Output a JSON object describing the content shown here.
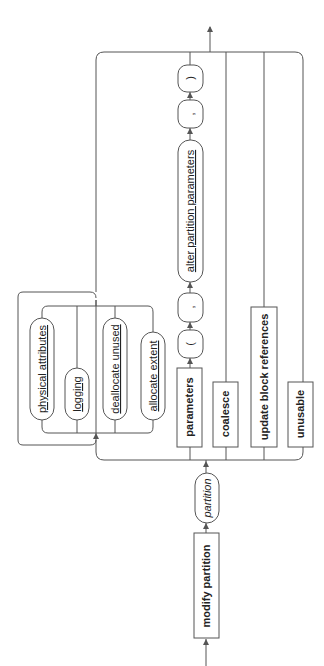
{
  "diagram": {
    "type": "railroad-syntax-diagram",
    "orientation": "rotated-90-ccw (flow bottom to top)",
    "line_color": "#555555",
    "text_color": "#222222",
    "nodes": {
      "modify_partition": "modify partition",
      "partition": "partition",
      "physical_attributes": "physical attributes",
      "logging": "logging",
      "deallocate_unused": "deallocate unused",
      "allocate_extent": "allocate extent",
      "parameters": "parameters",
      "open_paren": "(",
      "comma1": ",",
      "alter_partition_parameters": "alter partition parameters",
      "comma2": ",",
      "close_paren": ")",
      "coalesce": "coalesce",
      "update_block_references": "update block references",
      "unusable": "unusable"
    },
    "node_kinds": {
      "keywords": [
        "modify partition",
        "parameters",
        "coalesce",
        "update block references",
        "unusable"
      ],
      "variables": [
        "partition"
      ],
      "references": [
        "physical attributes",
        "logging",
        "deallocate unused",
        "allocate extent",
        "alter partition parameters"
      ],
      "literals": [
        "(",
        ",",
        ",",
        ")"
      ]
    }
  }
}
